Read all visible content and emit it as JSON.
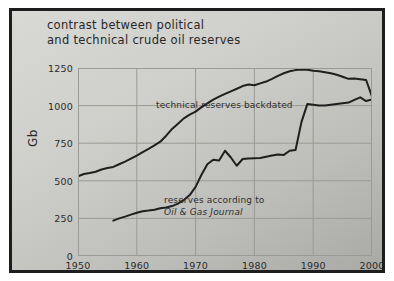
{
  "title": {
    "line1": "contrast between political",
    "line2": "and technical crude oil reserves"
  },
  "annotations": {
    "technical": "technical reserves backdated",
    "ogj_line1": "reserves according to",
    "ogj_line2": "Oil & Gas Journal"
  },
  "colors": {
    "line": "#1f1f1f",
    "grid": "#9a9a96",
    "frame": "#1d1d1d",
    "background": "#cfcfcb",
    "text": "#2b2b2b"
  },
  "chart_data": {
    "type": "line",
    "title": "contrast between political and technical crude oil reserves",
    "xlabel": "",
    "ylabel": "Gb",
    "xlim": [
      1950,
      2000
    ],
    "ylim": [
      0,
      1250
    ],
    "xticks": [
      1950,
      1960,
      1970,
      1980,
      1990,
      2000
    ],
    "yticks": [
      0,
      250,
      500,
      750,
      1000,
      1250
    ],
    "grid": true,
    "legend_position": "inline-annotations",
    "series": [
      {
        "name": "technical reserves backdated",
        "x": [
          1950,
          1951,
          1952,
          1953,
          1954,
          1955,
          1956,
          1957,
          1958,
          1959,
          1960,
          1961,
          1962,
          1963,
          1964,
          1965,
          1966,
          1967,
          1968,
          1969,
          1970,
          1971,
          1972,
          1973,
          1974,
          1975,
          1976,
          1977,
          1978,
          1979,
          1980,
          1981,
          1982,
          1983,
          1984,
          1985,
          1986,
          1987,
          1988,
          1989,
          1990,
          1991,
          1992,
          1993,
          1994,
          1995,
          1996,
          1997,
          1998,
          1999,
          2000
        ],
        "y": [
          530,
          545,
          552,
          560,
          575,
          585,
          592,
          610,
          628,
          648,
          668,
          690,
          712,
          735,
          760,
          800,
          845,
          880,
          915,
          940,
          960,
          990,
          1015,
          1040,
          1060,
          1078,
          1095,
          1112,
          1130,
          1140,
          1135,
          1148,
          1160,
          1178,
          1198,
          1215,
          1228,
          1236,
          1240,
          1238,
          1232,
          1228,
          1222,
          1215,
          1205,
          1192,
          1178,
          1180,
          1175,
          1170,
          1060
        ]
      },
      {
        "name": "reserves according to Oil & Gas Journal",
        "x": [
          1956,
          1957,
          1958,
          1959,
          1960,
          1961,
          1962,
          1963,
          1964,
          1965,
          1966,
          1967,
          1968,
          1969,
          1970,
          1971,
          1972,
          1973,
          1974,
          1975,
          1976,
          1977,
          1978,
          1979,
          1980,
          1981,
          1982,
          1983,
          1984,
          1985,
          1986,
          1987,
          1988,
          1989,
          1990,
          1991,
          1992,
          1993,
          1994,
          1995,
          1996,
          1997,
          1998,
          1999,
          2000
        ],
        "y": [
          235,
          250,
          262,
          275,
          288,
          298,
          302,
          308,
          318,
          322,
          332,
          348,
          372,
          405,
          460,
          540,
          610,
          640,
          635,
          700,
          655,
          600,
          645,
          648,
          650,
          652,
          660,
          668,
          675,
          672,
          700,
          705,
          890,
          1010,
          1005,
          1000,
          1000,
          1005,
          1010,
          1015,
          1020,
          1038,
          1055,
          1030,
          1040
        ]
      }
    ]
  }
}
